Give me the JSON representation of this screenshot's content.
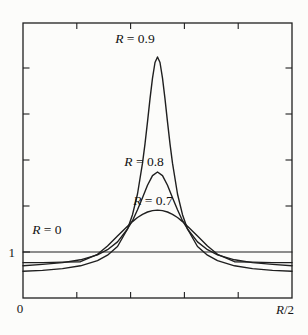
{
  "figure": {
    "background": "#fcfcfa",
    "ink": "#1f1f1f",
    "text_color": "#121212"
  },
  "chart_data": {
    "type": "line",
    "title": "",
    "xlabel": "",
    "ylabel": "",
    "legend": "none",
    "grid": false,
    "frame": "box-with-inward-ticks",
    "x_axis": {
      "range": [
        0,
        1
      ],
      "start_label": "0",
      "end_label_var": "R",
      "end_label_rest": "/2",
      "tick_positions": [
        0.2,
        0.4,
        0.6,
        0.8
      ]
    },
    "y_axis": {
      "range": [
        0,
        5.98
      ],
      "baseline_value": 1,
      "baseline_label": "1",
      "unlabeled_tick_values": [
        2,
        3,
        4,
        5
      ]
    },
    "series": [
      {
        "name": "R = 0",
        "label_var": "R",
        "label_rest": " = 0",
        "R": 0,
        "x": [
          0,
          1
        ],
        "v": [
          1,
          1
        ],
        "label_anchor": {
          "x": 0.089,
          "v": 1.48
        }
      },
      {
        "name": "R = 0.7",
        "label_var": "R",
        "label_rest": " = 0.7",
        "R": 0.7,
        "x": [
          0,
          0.0725,
          0.1468,
          0.2138,
          0.277,
          0.3141,
          0.3513,
          0.3885,
          0.4071,
          0.4257,
          0.4442,
          0.4628,
          0.4814,
          0.5,
          0.5186,
          0.5372,
          0.5558,
          0.5743,
          0.5929,
          0.6115,
          0.6487,
          0.6859,
          0.723,
          0.7862,
          0.8532,
          0.9275,
          1
        ],
        "v": [
          0.77,
          0.77,
          0.78,
          0.79,
          0.95,
          1.13,
          1.35,
          1.56,
          1.66,
          1.75,
          1.82,
          1.87,
          1.9,
          1.91,
          1.9,
          1.87,
          1.82,
          1.75,
          1.66,
          1.56,
          1.35,
          1.13,
          0.95,
          0.79,
          0.78,
          0.77,
          0.77
        ],
        "label_anchor": {
          "x": 0.483,
          "v": 2.11
        }
      },
      {
        "name": "R = 0.8",
        "label_var": "R",
        "label_rest": " = 0.8",
        "R": 0.8,
        "x": [
          0,
          0.0725,
          0.1468,
          0.2138,
          0.277,
          0.3141,
          0.3513,
          0.3885,
          0.4071,
          0.4257,
          0.4442,
          0.4628,
          0.4814,
          0.5,
          0.5186,
          0.5372,
          0.5558,
          0.5743,
          0.5929,
          0.6115,
          0.6487,
          0.6859,
          0.723,
          0.7862,
          0.8532,
          0.9275,
          1
        ],
        "v": [
          0.7,
          0.73,
          0.77,
          0.83,
          0.94,
          1.05,
          1.22,
          1.5,
          1.68,
          1.92,
          2.18,
          2.45,
          2.66,
          2.74,
          2.66,
          2.45,
          2.18,
          1.92,
          1.68,
          1.5,
          1.22,
          1.05,
          0.94,
          0.83,
          0.77,
          0.73,
          0.7
        ],
        "label_anchor": {
          "x": 0.45,
          "v": 2.96
        }
      },
      {
        "name": "R = 0.9",
        "label_var": "R",
        "label_rest": " = 0.9",
        "R": 0.9,
        "x": [
          0,
          0.0725,
          0.1468,
          0.2138,
          0.277,
          0.3141,
          0.3513,
          0.3885,
          0.4071,
          0.4257,
          0.4442,
          0.4535,
          0.4628,
          0.4721,
          0.4814,
          0.4907,
          0.5,
          0.5093,
          0.5186,
          0.5279,
          0.5372,
          0.5465,
          0.5558,
          0.5743,
          0.5929,
          0.6115,
          0.6487,
          0.6859,
          0.723,
          0.7862,
          0.8532,
          0.9275,
          1
        ],
        "v": [
          0.58,
          0.6,
          0.64,
          0.7,
          0.81,
          0.93,
          1.12,
          1.5,
          1.81,
          2.26,
          2.93,
          3.35,
          3.83,
          4.33,
          4.78,
          5.12,
          5.24,
          5.12,
          4.78,
          4.33,
          3.83,
          3.35,
          2.93,
          2.26,
          1.81,
          1.5,
          1.12,
          0.93,
          0.81,
          0.7,
          0.64,
          0.6,
          0.58
        ],
        "label_anchor": {
          "x": 0.416,
          "v": 5.65
        }
      }
    ]
  }
}
